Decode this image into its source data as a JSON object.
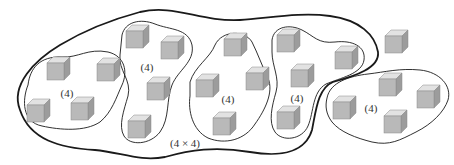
{
  "diagram": {
    "colors": {
      "outline": "#1a1a1a",
      "cube_front": "#b9b9b9",
      "cube_top": "#e2e2e2",
      "cube_side": "#9c9c9c",
      "cube_edge": "#8a8a8a",
      "label": "#333333"
    },
    "outer_group": {
      "label": "(4 × 4)",
      "label_pos": [
        185,
        144
      ]
    },
    "groups": [
      {
        "label": "(4)",
        "label_pos": [
          67,
          94
        ],
        "cubes": [
          [
            47,
            63
          ],
          [
            97,
            64
          ],
          [
            27,
            105
          ],
          [
            71,
            103
          ]
        ]
      },
      {
        "label": "(4)",
        "label_pos": [
          147,
          68
        ],
        "cubes": [
          [
            126,
            31
          ],
          [
            161,
            42
          ],
          [
            147,
            83
          ],
          [
            128,
            121
          ]
        ]
      },
      {
        "label": "(4)",
        "label_pos": [
          228,
          100
        ],
        "cubes": [
          [
            224,
            39
          ],
          [
            196,
            80
          ],
          [
            246,
            73
          ],
          [
            213,
            118
          ]
        ]
      },
      {
        "label": "(4)",
        "label_pos": [
          297,
          99
        ],
        "cubes": [
          [
            277,
            35
          ],
          [
            335,
            52
          ],
          [
            291,
            70
          ],
          [
            277,
            112
          ]
        ]
      },
      {
        "label": "(4)",
        "label_pos": [
          371,
          109
        ],
        "cubes": [
          [
            379,
            79
          ],
          [
            417,
            91
          ],
          [
            333,
            102
          ],
          [
            384,
            116
          ]
        ]
      }
    ],
    "lone_cube": [
      385,
      36
    ]
  }
}
